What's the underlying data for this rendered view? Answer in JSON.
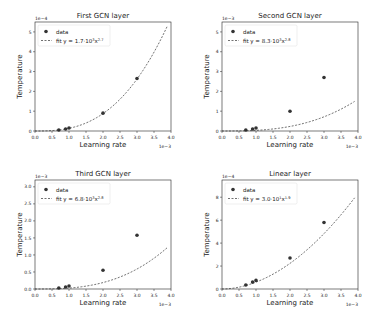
{
  "chart_data": [
    {
      "type": "scatter",
      "title": "First GCN layer",
      "xlabel": "Learning rate",
      "ylabel": "Temperature",
      "x_multiplier": "1e−3",
      "y_multiplier": "1e−4",
      "xlim": [
        0.0,
        4.0
      ],
      "ylim": [
        0,
        5.5
      ],
      "xticks": [
        "0.0",
        "0.5",
        "1.0",
        "1.5",
        "2.0",
        "2.5",
        "3.0",
        "3.5",
        "4.0"
      ],
      "yticks": [
        "0",
        "1",
        "2",
        "3",
        "4",
        "5"
      ],
      "legend": [
        "data",
        "fit y = 1.7·10^3x^2.7"
      ],
      "fit": {
        "a": 1700.0,
        "b": 2.7
      },
      "series": [
        {
          "name": "data",
          "x": [
            0.7,
            0.9,
            1.0,
            2.0,
            3.0
          ],
          "y": [
            0.05,
            0.1,
            0.15,
            0.9,
            2.65
          ]
        }
      ]
    },
    {
      "type": "scatter",
      "title": "Second GCN layer",
      "xlabel": "Learning rate",
      "ylabel": "Temperature",
      "x_multiplier": "1e−3",
      "y_multiplier": "1e−3",
      "xlim": [
        0.0,
        4.0
      ],
      "ylim": [
        0,
        5.5
      ],
      "xticks": [
        "0.0",
        "0.5",
        "1.0",
        "1.5",
        "2.0",
        "2.5",
        "3.0",
        "3.5",
        "4.0"
      ],
      "yticks": [
        "0",
        "1",
        "2",
        "3",
        "4",
        "5"
      ],
      "legend": [
        "data",
        "fit y = 8.3·10^3x^2.8"
      ],
      "fit": {
        "a": 8300.0,
        "b": 2.8
      },
      "series": [
        {
          "name": "data",
          "x": [
            0.7,
            0.9,
            1.0,
            2.0,
            3.0
          ],
          "y": [
            0.05,
            0.1,
            0.15,
            1.0,
            2.7
          ]
        }
      ]
    },
    {
      "type": "scatter",
      "title": "Third GCN layer",
      "xlabel": "Learning rate",
      "ylabel": "Temperature",
      "x_multiplier": "1e−3",
      "y_multiplier": "1e−3",
      "xlim": [
        0.0,
        4.0
      ],
      "ylim": [
        0,
        3.2
      ],
      "xticks": [
        "0.0",
        "0.5",
        "1.0",
        "1.5",
        "2.0",
        "2.5",
        "3.0",
        "3.5",
        "4.0"
      ],
      "yticks": [
        "0.0",
        "0.5",
        "1.0",
        "1.5",
        "2.0",
        "2.5",
        "3.0"
      ],
      "legend": [
        "data",
        "fit y = 6.8·10^3x^2.8"
      ],
      "fit": {
        "a": 6800.0,
        "b": 2.8
      },
      "series": [
        {
          "name": "data",
          "x": [
            0.7,
            0.9,
            1.0,
            2.0,
            3.0
          ],
          "y": [
            0.03,
            0.06,
            0.09,
            0.55,
            1.58
          ]
        }
      ]
    },
    {
      "type": "scatter",
      "title": "Linear layer",
      "xlabel": "Learning rate",
      "ylabel": "Temperature",
      "x_multiplier": "1e−3",
      "y_multiplier": "1e−4",
      "xlim": [
        0.0,
        4.0
      ],
      "ylim": [
        0,
        9.5
      ],
      "xticks": [
        "0.0",
        "0.5",
        "1.0",
        "1.5",
        "2.0",
        "2.5",
        "3.0",
        "3.5",
        "4.0"
      ],
      "yticks": [
        "0",
        "2",
        "4",
        "6",
        "8"
      ],
      "legend": [
        "data",
        "fit y = 3.0·10^1x^1.9"
      ],
      "fit": {
        "a": 30.0,
        "b": 1.9
      },
      "series": [
        {
          "name": "data",
          "x": [
            0.7,
            0.9,
            1.0,
            2.0,
            3.0
          ],
          "y": [
            0.35,
            0.6,
            0.75,
            2.7,
            5.8
          ]
        }
      ]
    }
  ]
}
